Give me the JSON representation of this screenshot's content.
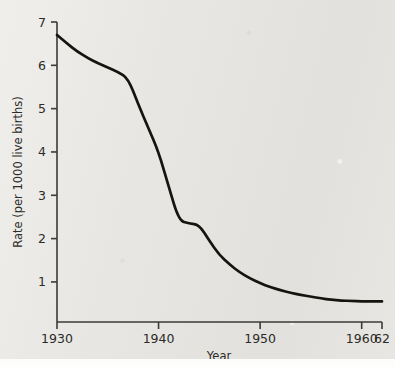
{
  "chart_data": {
    "type": "line",
    "title": "",
    "xlabel": "Year",
    "ylabel": "Rate (per 1000 live births)",
    "xlim": [
      1930,
      1962
    ],
    "ylim": [
      0.25,
      7.0
    ],
    "grid": false,
    "legend": false,
    "x_ticks": [
      1930,
      1940,
      1950,
      1960,
      1962
    ],
    "x_tick_labels": [
      "1930",
      "1940",
      "1950",
      "1960",
      "62"
    ],
    "y_ticks": [
      1,
      2,
      3,
      4,
      5,
      6,
      7
    ],
    "y_tick_labels": [
      "1",
      "2",
      "3",
      "4",
      "5",
      "6",
      "7"
    ],
    "series": [
      {
        "name": "Rate",
        "x": [
          1930,
          1931,
          1932,
          1933,
          1934,
          1935,
          1936,
          1937,
          1938,
          1939,
          1940,
          1941,
          1942,
          1943,
          1944,
          1945,
          1946,
          1947,
          1948,
          1949,
          1950,
          1951,
          1952,
          1953,
          1954,
          1955,
          1956,
          1957,
          1958,
          1959,
          1960,
          1961,
          1962
        ],
        "values": [
          6.7,
          6.5,
          6.32,
          6.17,
          6.05,
          5.95,
          5.85,
          5.7,
          5.1,
          4.55,
          4.0,
          3.2,
          2.42,
          2.35,
          2.32,
          1.95,
          1.62,
          1.4,
          1.22,
          1.08,
          0.97,
          0.88,
          0.81,
          0.75,
          0.7,
          0.66,
          0.62,
          0.59,
          0.57,
          0.56,
          0.55,
          0.55,
          0.55
        ]
      }
    ],
    "annotations": [
      {
        "text": "steep decline begins",
        "x": 1937
      },
      {
        "text": "plateau",
        "x": 1943
      }
    ]
  },
  "axis": {
    "y_title": "Rate (per 1000 live births)",
    "x_title": "Year"
  }
}
